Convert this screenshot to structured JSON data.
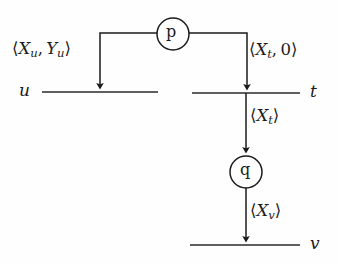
{
  "diagram": {
    "type": "message-sequence-diagram",
    "title": "",
    "colors": {
      "background": "#fefefe",
      "stroke": "#1b1b1b",
      "text": "#1b1b1b"
    },
    "processes": [
      {
        "id": "u",
        "label": "u",
        "timeline_y": 92,
        "x_start": 42,
        "x_end": 158,
        "label_x": 19
      },
      {
        "id": "t",
        "label": "t",
        "timeline_y": 93,
        "x_start": 192,
        "x_end": 300,
        "label_x": 310
      },
      {
        "id": "v",
        "label": "v",
        "timeline_y": 245,
        "x_start": 190,
        "x_end": 300,
        "label_x": 310
      }
    ],
    "nodes": [
      {
        "id": "p",
        "label": "p",
        "cx": 173,
        "cy": 34,
        "r": 16
      },
      {
        "id": "q",
        "label": "q",
        "cx": 246,
        "cy": 172,
        "r": 16
      }
    ],
    "messages": [
      {
        "id": "msg-xu-yu",
        "label": "⟨Xu, Yu⟩",
        "parts": {
          "open": "⟨",
          "var1": "X",
          "sub1": "u",
          "comma": ", ",
          "var2": "Y",
          "sub2": "u",
          "close": "⟩"
        },
        "from": "p",
        "to": "u",
        "direction": "down"
      },
      {
        "id": "msg-xt-zero",
        "label": "⟨Xt, 0⟩",
        "parts": {
          "open": "⟨",
          "var1": "X",
          "sub1": "t",
          "comma": ", ",
          "num": "0",
          "close": "⟩"
        },
        "from": "p",
        "to": "t",
        "direction": "down"
      },
      {
        "id": "msg-xt",
        "label": "⟨Xt⟩",
        "parts": {
          "open": "⟨",
          "var1": "X",
          "sub1": "t",
          "close": "⟩"
        },
        "from": "t",
        "to": "q",
        "direction": "down"
      },
      {
        "id": "msg-xv",
        "label": "⟨Xv⟩",
        "parts": {
          "open": "⟨",
          "var1": "X",
          "sub1": "v",
          "close": "⟩"
        },
        "from": "q",
        "to": "v",
        "direction": "down"
      }
    ]
  },
  "labels": {
    "xu_yu_open": "⟨",
    "xu_yu_x": "X",
    "xu_yu_xsub": "u",
    "xu_yu_comma": ", ",
    "xu_yu_y": "Y",
    "xu_yu_ysub": "u",
    "xu_yu_close": "⟩",
    "xt0_open": "⟨",
    "xt0_x": "X",
    "xt0_xsub": "t",
    "xt0_comma": ", ",
    "xt0_zero": "0",
    "xt0_close": "⟩",
    "xt_open": "⟨",
    "xt_x": "X",
    "xt_xsub": "t",
    "xt_close": "⟩",
    "xv_open": "⟨",
    "xv_x": "X",
    "xv_xsub": "v",
    "xv_close": "⟩",
    "process_u": "u",
    "process_t": "t",
    "process_v": "v",
    "node_p": "p",
    "node_q": "q"
  }
}
